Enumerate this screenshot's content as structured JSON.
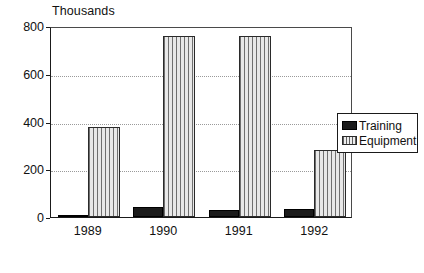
{
  "chart_data": {
    "type": "bar",
    "title": "",
    "subtitle": "",
    "xlabel": "",
    "ylabel": "Thousands",
    "categories": [
      "1989",
      "1990",
      "1991",
      "1992"
    ],
    "series": [
      {
        "name": "Training",
        "values": [
          10,
          40,
          28,
          35
        ],
        "color": "#1b1b1b",
        "fill": "solid"
      },
      {
        "name": "Equipment",
        "values": [
          378,
          758,
          758,
          280
        ],
        "color": "#d2d2d2",
        "fill": "vertical-hatch"
      }
    ],
    "ylim": [
      0,
      800
    ],
    "yticks": [
      0,
      200,
      400,
      600,
      800
    ],
    "ytick_labels": [
      "0",
      "200",
      "400",
      "600",
      "800"
    ],
    "grid": true,
    "grid_style": "dotted",
    "legend_position": "right",
    "legend_entries": [
      "Training",
      "Equipment"
    ]
  },
  "axis": {
    "y_title": "Thousands"
  },
  "legend": {
    "items": [
      {
        "label": "Training"
      },
      {
        "label": "Equipment"
      }
    ]
  },
  "colors": {
    "axis": "#1a1a1a",
    "grid": "#9a9a9a",
    "training": "#1b1b1b",
    "equipment": "#d2d2d2",
    "background": "#ffffff",
    "text": "#111111"
  }
}
